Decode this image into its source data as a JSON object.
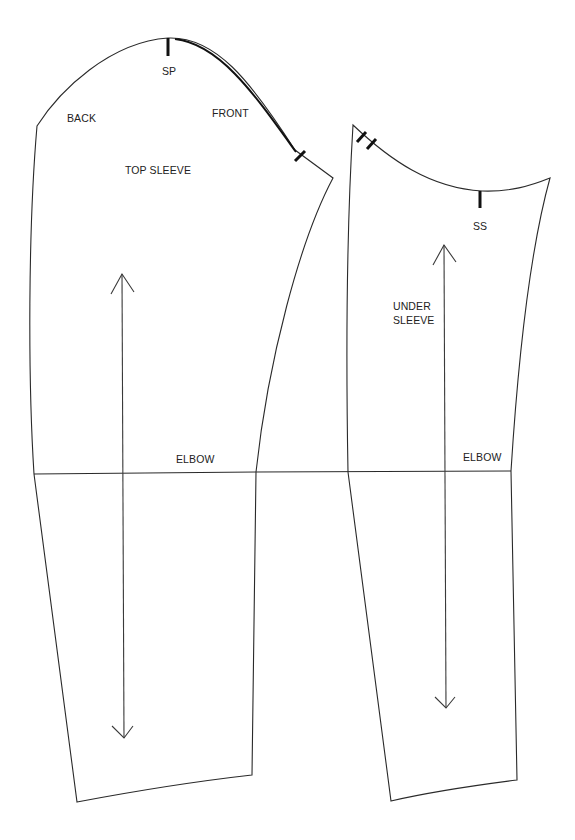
{
  "diagram": {
    "type": "sewing-pattern",
    "pieces": [
      {
        "id": "top-sleeve",
        "name": "TOP SLEEVE",
        "labels": {
          "shoulder_point": "SP",
          "back": "BACK",
          "front": "FRONT",
          "elbow": "ELBOW"
        },
        "notches": [
          "shoulder-point",
          "front-single"
        ],
        "grainline": "double-arrow"
      },
      {
        "id": "under-sleeve",
        "name_line1": "UNDER",
        "name_line2": "SLEEVE",
        "labels": {
          "side_seam": "SS",
          "elbow": "ELBOW"
        },
        "notches": [
          "back-double",
          "side-seam"
        ],
        "grainline": "double-arrow"
      }
    ]
  }
}
